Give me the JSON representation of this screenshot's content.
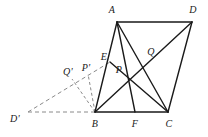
{
  "figure": {
    "type": "geometry-diagram",
    "width": 208,
    "height": 137,
    "background_color": "#ffffff",
    "stroke_color": "#1a1a1a",
    "dashed_stroke_color": "#8a8a8a",
    "solid_stroke_width": 1.4,
    "dashed_stroke_width": 1.0,
    "dash_pattern": "4 3",
    "points": {
      "A": {
        "x": 117,
        "y": 22,
        "label": "A",
        "label_x": 112,
        "label_y": 10
      },
      "D": {
        "x": 192,
        "y": 22,
        "label": "D",
        "label_x": 193,
        "label_y": 10
      },
      "B": {
        "x": 95,
        "y": 112,
        "label": "B",
        "label_x": 95,
        "label_y": 124
      },
      "F": {
        "x": 135,
        "y": 112,
        "label": "F",
        "label_x": 135,
        "label_y": 124
      },
      "C": {
        "x": 168,
        "y": 112,
        "label": "C",
        "label_x": 169,
        "label_y": 124
      },
      "E": {
        "x": 110,
        "y": 62,
        "label": "E",
        "label_x": 104,
        "label_y": 57
      },
      "P": {
        "x": 123,
        "y": 61,
        "label": "P",
        "label_x": 119,
        "label_y": 70
      },
      "Q": {
        "x": 147,
        "y": 47,
        "label": "Q",
        "label_x": 151,
        "label_y": 52
      },
      "Pprime": {
        "x": 88,
        "y": 74,
        "label": "P'",
        "label_x": 86,
        "label_y": 68
      },
      "Qprime": {
        "x": 72,
        "y": 79,
        "label": "Q'",
        "label_x": 68,
        "label_y": 72
      },
      "Dprime": {
        "x": 28,
        "y": 112,
        "label": "D'",
        "label_x": 15,
        "label_y": 119
      }
    },
    "solid_segments": [
      {
        "name": "segment-A-D",
        "from": "A",
        "to": "D"
      },
      {
        "name": "segment-A-B",
        "from": "A",
        "to": "B"
      },
      {
        "name": "segment-D-C",
        "from": "D",
        "to": "C"
      },
      {
        "name": "segment-B-C",
        "from": "B",
        "to": "C"
      },
      {
        "name": "segment-A-F",
        "from": "A",
        "to": "F"
      },
      {
        "name": "segment-A-C",
        "from": "A",
        "to": "C"
      },
      {
        "name": "segment-B-D",
        "from": "B",
        "to": "D"
      },
      {
        "name": "segment-E-C",
        "from": "E",
        "to": "C"
      },
      {
        "name": "segment-F-A-vertical",
        "from": "F",
        "to": "A"
      }
    ],
    "dashed_segments": [
      {
        "name": "segment-Dprime-E",
        "from": "Dprime",
        "to": "E"
      },
      {
        "name": "segment-Dprime-B",
        "from": "Dprime",
        "to": "B"
      },
      {
        "name": "segment-B-Pprime",
        "from": "B",
        "to": "Pprime"
      },
      {
        "name": "segment-B-Qprime",
        "from": "B",
        "to": "Qprime"
      }
    ]
  }
}
